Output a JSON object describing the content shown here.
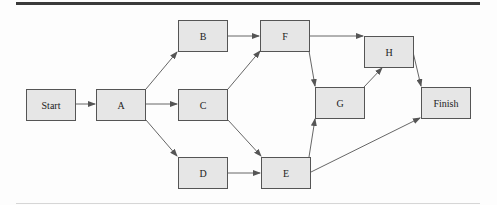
{
  "diagram": {
    "type": "network-activity-on-node",
    "nodes": [
      {
        "id": "start",
        "label": "Start",
        "x": 26,
        "y": 89
      },
      {
        "id": "a",
        "label": "A",
        "x": 96,
        "y": 89
      },
      {
        "id": "b",
        "label": "B",
        "x": 178,
        "y": 20
      },
      {
        "id": "c",
        "label": "C",
        "x": 178,
        "y": 89
      },
      {
        "id": "d",
        "label": "D",
        "x": 178,
        "y": 157
      },
      {
        "id": "f",
        "label": "F",
        "x": 260,
        "y": 20
      },
      {
        "id": "e",
        "label": "E",
        "x": 261,
        "y": 157
      },
      {
        "id": "g",
        "label": "G",
        "x": 315,
        "y": 87
      },
      {
        "id": "h",
        "label": "H",
        "x": 364,
        "y": 36
      },
      {
        "id": "finish",
        "label": "Finish",
        "x": 421,
        "y": 87
      }
    ],
    "edges": [
      {
        "from": "Start",
        "to": "A"
      },
      {
        "from": "A",
        "to": "B"
      },
      {
        "from": "A",
        "to": "C"
      },
      {
        "from": "A",
        "to": "D"
      },
      {
        "from": "B",
        "to": "F"
      },
      {
        "from": "C",
        "to": "F"
      },
      {
        "from": "C",
        "to": "E"
      },
      {
        "from": "D",
        "to": "E"
      },
      {
        "from": "F",
        "to": "H"
      },
      {
        "from": "F",
        "to": "G"
      },
      {
        "from": "E",
        "to": "G"
      },
      {
        "from": "E",
        "to": "Finish"
      },
      {
        "from": "G",
        "to": "H"
      },
      {
        "from": "H",
        "to": "Finish"
      }
    ],
    "colors": {
      "node_fill": "#e6e6e6",
      "node_border": "#555555",
      "edge": "#555555",
      "rule": "#3a3a3a"
    }
  }
}
